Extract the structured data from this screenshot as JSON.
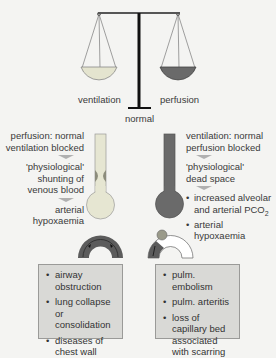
{
  "balance": {
    "left_label": "ventilation",
    "right_label": "perfusion",
    "center_label": "normal"
  },
  "left_panel": {
    "title_line1": "perfusion: normal",
    "title_line2": "ventilation blocked",
    "effect_line1": "'physiological'",
    "effect_line2": "shunting of",
    "effect_line3": "venous blood",
    "result_line1": "arterial",
    "result_line2": "hypoxaemia",
    "causes": [
      "airway obstruction",
      "lung collapse or consolidation",
      "diseases of chest wall"
    ]
  },
  "right_panel": {
    "title_line1": "ventilation: normal",
    "title_line2": "perfusion blocked",
    "effect_line1": "'physiological'",
    "effect_line2": "dead space",
    "result1_line1": "increased alveolar",
    "result1_line2": "and arterial PCO",
    "result1_sub": "2",
    "result2_line1": "arterial",
    "result2_line2": "hypoxaemia",
    "causes": [
      "pulm. embolism",
      "pulm. arteritis",
      "loss of capillary bed associated with scarring"
    ]
  },
  "colors": {
    "ventilation_pan": "#e4e4cf",
    "perfusion_pan": "#6a6a6a",
    "box_bg": "#d9d9d6",
    "background": "#f4f4f2"
  }
}
